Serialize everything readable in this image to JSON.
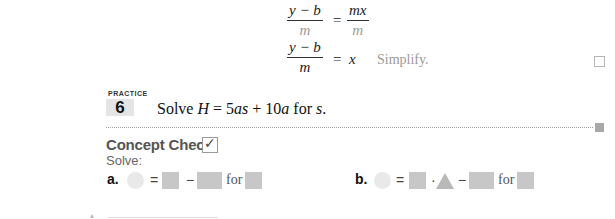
{
  "steps": [
    {
      "lhs_numerator": "y − b",
      "lhs_denominator": "m",
      "equals": "=",
      "rhs_numerator": "mx",
      "rhs_denominator": "m",
      "note": ""
    },
    {
      "lhs_numerator": "y − b",
      "lhs_denominator": "m",
      "equals": "=",
      "rhs": "x",
      "note": "Simplify."
    }
  ],
  "practice": {
    "label": "PRACTICE",
    "number": "6",
    "problem_prefix": "Solve ",
    "problem_var": "H",
    "problem_mid": " = 5",
    "problem_as": "as",
    "problem_plus": " + 10",
    "problem_a": "a",
    "problem_for": " for ",
    "problem_s": "s",
    "problem_end": "."
  },
  "concept_check": {
    "title": "Concept Check",
    "checkmark": "✓",
    "instruction": "Solve:",
    "items": [
      {
        "label": "a.",
        "equals": "=",
        "minus": "−",
        "for": "for"
      },
      {
        "label": "b.",
        "equals": "=",
        "dot": "·",
        "minus": "−",
        "for": "for"
      }
    ]
  },
  "colors": {
    "circle": "#e9e9e9",
    "square": "#c7c7c7",
    "triangle": "#b9b9b9",
    "practice_badge": "#e4e4e4",
    "faint_text": "#9a9a9a"
  }
}
